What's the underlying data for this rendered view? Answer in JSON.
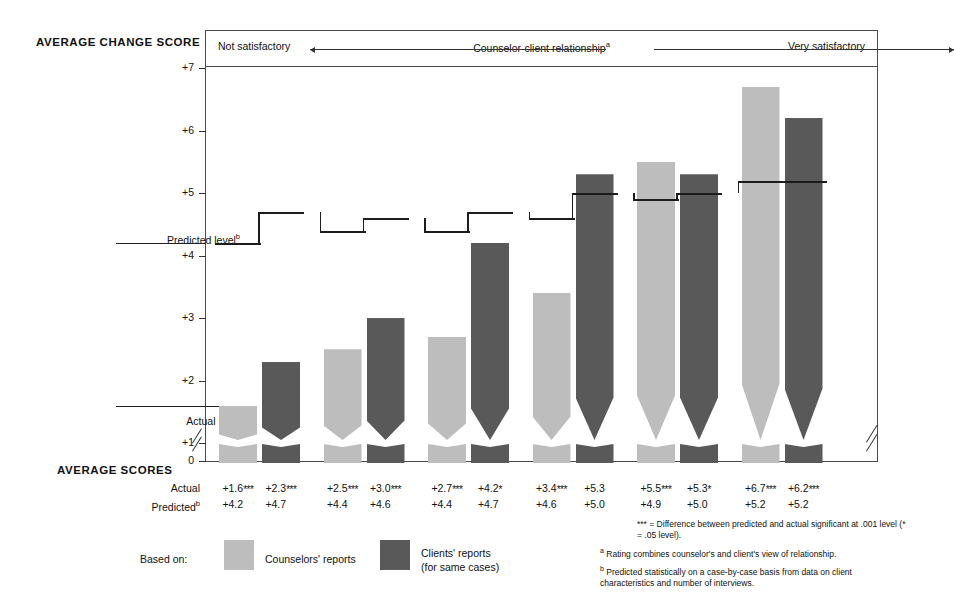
{
  "labels": {
    "avg_change_score": "AVERAGE CHANGE SCORE",
    "avg_scores": "AVERAGE SCORES",
    "row_actual": "Actual",
    "row_predicted": "Predicted",
    "row_predicted_mark": "b",
    "predicted_level": "Predicted level",
    "predicted_level_mark": "b",
    "actual_level": "Actual level",
    "based_on": "Based on:"
  },
  "scale_header": {
    "left": "Not satisfactory",
    "middle": "Counselor-client relationship",
    "middle_mark": "a",
    "right": "Very satisfactory"
  },
  "legend": {
    "items": [
      {
        "label": "Counselors' reports",
        "label2": "",
        "color": "#bdbdbd"
      },
      {
        "label": "Clients' reports",
        "label2": "(for same cases)",
        "color": "#595959"
      }
    ]
  },
  "footnotes": {
    "stars": "*** = Difference between predicted and actual significant at .001 level (* = .05 level).",
    "a_mark": "a",
    "a": "Rating combines counselor's and client's view of relationship.",
    "b_mark": "b",
    "b": "Predicted statistically on a case-by-case basis from data on client characteristics and number of interviews."
  },
  "chart_data": {
    "type": "bar",
    "title": "AVERAGE CHANGE SCORE",
    "xlabel": "Counselor-client relationship",
    "ylabel": "Average change score",
    "ylim": [
      0,
      7
    ],
    "grid": false,
    "legend_position": "bottom",
    "axis_break": "y-axis broken between 0 and +1; x-axis broken at right edge",
    "yticks": [
      "0",
      "+1",
      "+2",
      "+3",
      "+4",
      "+5",
      "+6",
      "+7"
    ],
    "categories": [
      "1",
      "2",
      "3",
      "4",
      "5",
      "6"
    ],
    "series": [
      {
        "name": "Counselors' reports",
        "color": "#bdbdbd",
        "actual": [
          1.6,
          2.5,
          2.7,
          3.4,
          5.5,
          6.7
        ],
        "predicted": [
          4.2,
          4.4,
          4.4,
          4.6,
          4.9,
          5.2
        ],
        "significance": [
          "***",
          "***",
          "***",
          "***",
          "***",
          "***"
        ]
      },
      {
        "name": "Clients' reports (for same cases)",
        "color": "#595959",
        "actual": [
          2.3,
          3.0,
          4.2,
          5.3,
          5.3,
          6.2
        ],
        "predicted": [
          4.7,
          4.6,
          4.7,
          5.0,
          5.0,
          5.2
        ],
        "significance": [
          "***",
          "***",
          "*",
          "",
          "*",
          "***"
        ]
      }
    ],
    "bars": [
      {
        "series": "Counselors' reports",
        "actual": 1.6,
        "predicted": 4.2,
        "sig": "***"
      },
      {
        "series": "Clients' reports",
        "actual": 2.3,
        "predicted": 4.7,
        "sig": "***"
      },
      {
        "series": "Counselors' reports",
        "actual": 2.5,
        "predicted": 4.4,
        "sig": "***"
      },
      {
        "series": "Clients' reports",
        "actual": 3.0,
        "predicted": 4.6,
        "sig": "***"
      },
      {
        "series": "Counselors' reports",
        "actual": 2.7,
        "predicted": 4.4,
        "sig": "***"
      },
      {
        "series": "Clients' reports",
        "actual": 4.2,
        "predicted": 4.7,
        "sig": "*"
      },
      {
        "series": "Counselors' reports",
        "actual": 3.4,
        "predicted": 4.6,
        "sig": "***"
      },
      {
        "series": "Clients' reports",
        "actual": 5.3,
        "predicted": 5.0,
        "sig": ""
      },
      {
        "series": "Counselors' reports",
        "actual": 5.5,
        "predicted": 4.9,
        "sig": "***"
      },
      {
        "series": "Clients' reports",
        "actual": 5.3,
        "predicted": 5.0,
        "sig": "*"
      },
      {
        "series": "Counselors' reports",
        "actual": 6.7,
        "predicted": 5.2,
        "sig": "***"
      },
      {
        "series": "Clients' reports",
        "actual": 6.2,
        "predicted": 5.2,
        "sig": "***"
      }
    ]
  }
}
